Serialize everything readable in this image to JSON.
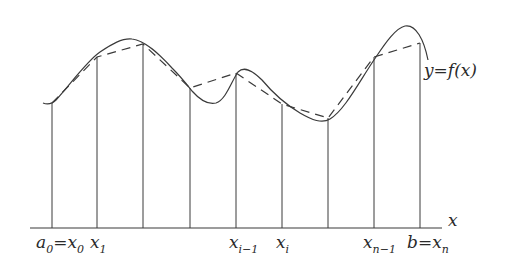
{
  "diagram": {
    "title": "",
    "axis_label": "x",
    "curve_label": "y=f(x)",
    "colors": {
      "stroke": "#3a3a3a",
      "background": "#ffffff"
    },
    "axis": {
      "y": 228,
      "x_start": 30,
      "x_end": 442
    },
    "partition_x": [
      52,
      97,
      143,
      190,
      236,
      282,
      328,
      374,
      420
    ],
    "curve_points_at_partitions_y": [
      103,
      57,
      44,
      88,
      73,
      104,
      118,
      57,
      43
    ],
    "tick_labels": [
      {
        "main": "a",
        "sub": "0",
        "eq": "=",
        "main2": "x",
        "sub2": "0"
      },
      {
        "main": "x",
        "sub": "1"
      },
      {
        "main": "x",
        "sub": "i−1"
      },
      {
        "main": "x",
        "sub": "i"
      },
      {
        "main": "x",
        "sub": "n−1"
      },
      {
        "main": "b",
        "eq": "=",
        "main2": "x",
        "sub2": "n"
      }
    ]
  }
}
